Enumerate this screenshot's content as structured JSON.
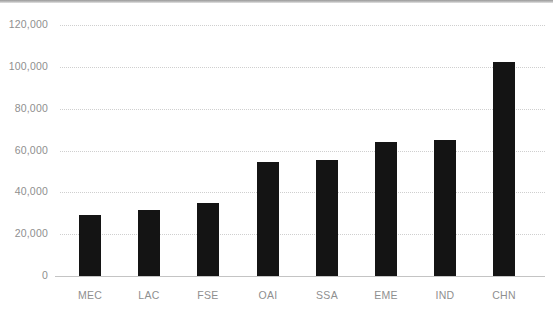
{
  "chart_data": {
    "type": "bar",
    "title": "",
    "subtitle": "",
    "xlabel": "",
    "ylabel": "",
    "categories": [
      "MEC",
      "LAC",
      "FSE",
      "OAI",
      "SSA",
      "EME",
      "IND",
      "CHN"
    ],
    "values": [
      29200,
      31500,
      34900,
      54500,
      55500,
      64100,
      65000,
      102300
    ],
    "series": [
      {
        "name": "",
        "values": [
          29200,
          31500,
          34900,
          54500,
          55500,
          64100,
          65000,
          102300
        ]
      }
    ],
    "ylim": [
      0,
      120000
    ],
    "ytick_values": [
      0,
      20000,
      40000,
      60000,
      80000,
      100000,
      120000
    ],
    "ytick_labels": [
      "0",
      "20,000",
      "40,000",
      "60,000",
      "80,000",
      "100,000",
      "120,000"
    ],
    "xtick_labels": [
      "MEC",
      "LAC",
      "FSE",
      "OAI",
      "SSA",
      "EME",
      "IND",
      "CHN"
    ],
    "grid": true,
    "grid_axis": "y",
    "grid_style": "dotted",
    "legend": false,
    "legend_position": "none",
    "annotations": [],
    "colors": {
      "bar": "#141414",
      "grid": "#cfcfcf",
      "axis": "#c4c4c4",
      "tick_label": "#8f8f8f",
      "background": "#ffffff",
      "top_rule": "#9a9a9a"
    }
  },
  "layout": {
    "plot_left": 60,
    "plot_right": 545,
    "baseline_y": 276,
    "top_value_y": 25,
    "bar_width": 22,
    "bar_pitch": 59.2,
    "first_bar_center": 90
  }
}
